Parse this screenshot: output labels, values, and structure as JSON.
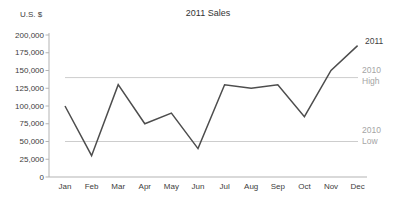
{
  "chart_data": {
    "type": "line",
    "title": "2011 Sales",
    "y_axis_unit": "U.S. $",
    "xlabel": "",
    "ylabel": "U.S. $",
    "categories": [
      "Jan",
      "Feb",
      "Mar",
      "Apr",
      "May",
      "Jun",
      "Jul",
      "Aug",
      "Sep",
      "Oct",
      "Nov",
      "Dec"
    ],
    "series": [
      {
        "name": "2011",
        "values": [
          100000,
          30000,
          130000,
          75000,
          90000,
          40000,
          130000,
          125000,
          130000,
          85000,
          150000,
          185000
        ]
      }
    ],
    "reference_lines": [
      {
        "label": "2010 High",
        "value": 140000
      },
      {
        "label": "2010 Low",
        "value": 50000
      }
    ],
    "ylim": [
      0,
      200000
    ],
    "ytick_step": 25000,
    "ytick_labels": [
      "0",
      "25,000",
      "50,000",
      "75,000",
      "100,000",
      "125,000",
      "150,000",
      "175,000",
      "200,000"
    ],
    "grid": "off",
    "legend": "end-of-line-labels",
    "colors": {
      "series_line": "#4d4d4d",
      "reference_line": "#cdcdcd",
      "reference_label": "#a5a5a5",
      "axis_line": "#b3b3b3",
      "text": "#3d3d3d",
      "background": "#ffffff"
    }
  }
}
